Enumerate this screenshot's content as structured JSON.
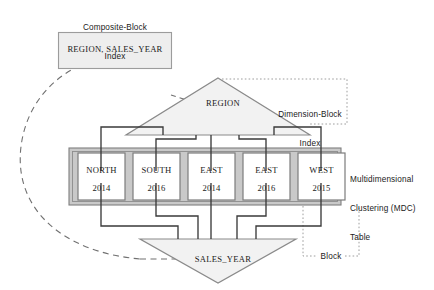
{
  "diagram": {
    "title_note": "Multidimensional Clustering (MDC) table with dimension-block and composite-block indexes",
    "colors": {
      "fill_light_gray": "#f1f1f1",
      "fill_band_gray": "#c9c9c9",
      "stroke_gray": "#8a8a8a",
      "stroke_dark": "#3a3a3a",
      "text": "#1a1a1a",
      "dotted": "#9a9a9a",
      "dashed": "#707070",
      "block_fill": "#ffffff"
    },
    "labels": {
      "composite_block_index_line1": "Composite-Block",
      "composite_block_index_line2": "Index",
      "dimension_block_index_line1": "Dimension-Block",
      "dimension_block_index_line2": "Index",
      "mdc_table_line1": "Multidimensional",
      "mdc_table_line2": "Clustering (MDC)",
      "mdc_table_line3": "Table",
      "block_callout": "Block"
    },
    "composite_index_box": {
      "text": "REGION, SALES_YEAR"
    },
    "dimension_indexes": {
      "top": "REGION",
      "bottom": "SALES_YEAR"
    },
    "blocks": [
      {
        "region": "NORTH",
        "year": "2014"
      },
      {
        "region": "SOUTH",
        "year": "2016"
      },
      {
        "region": "EAST",
        "year": "2014"
      },
      {
        "region": "EAST",
        "year": "2016"
      },
      {
        "region": "WEST",
        "year": "2015"
      }
    ]
  }
}
